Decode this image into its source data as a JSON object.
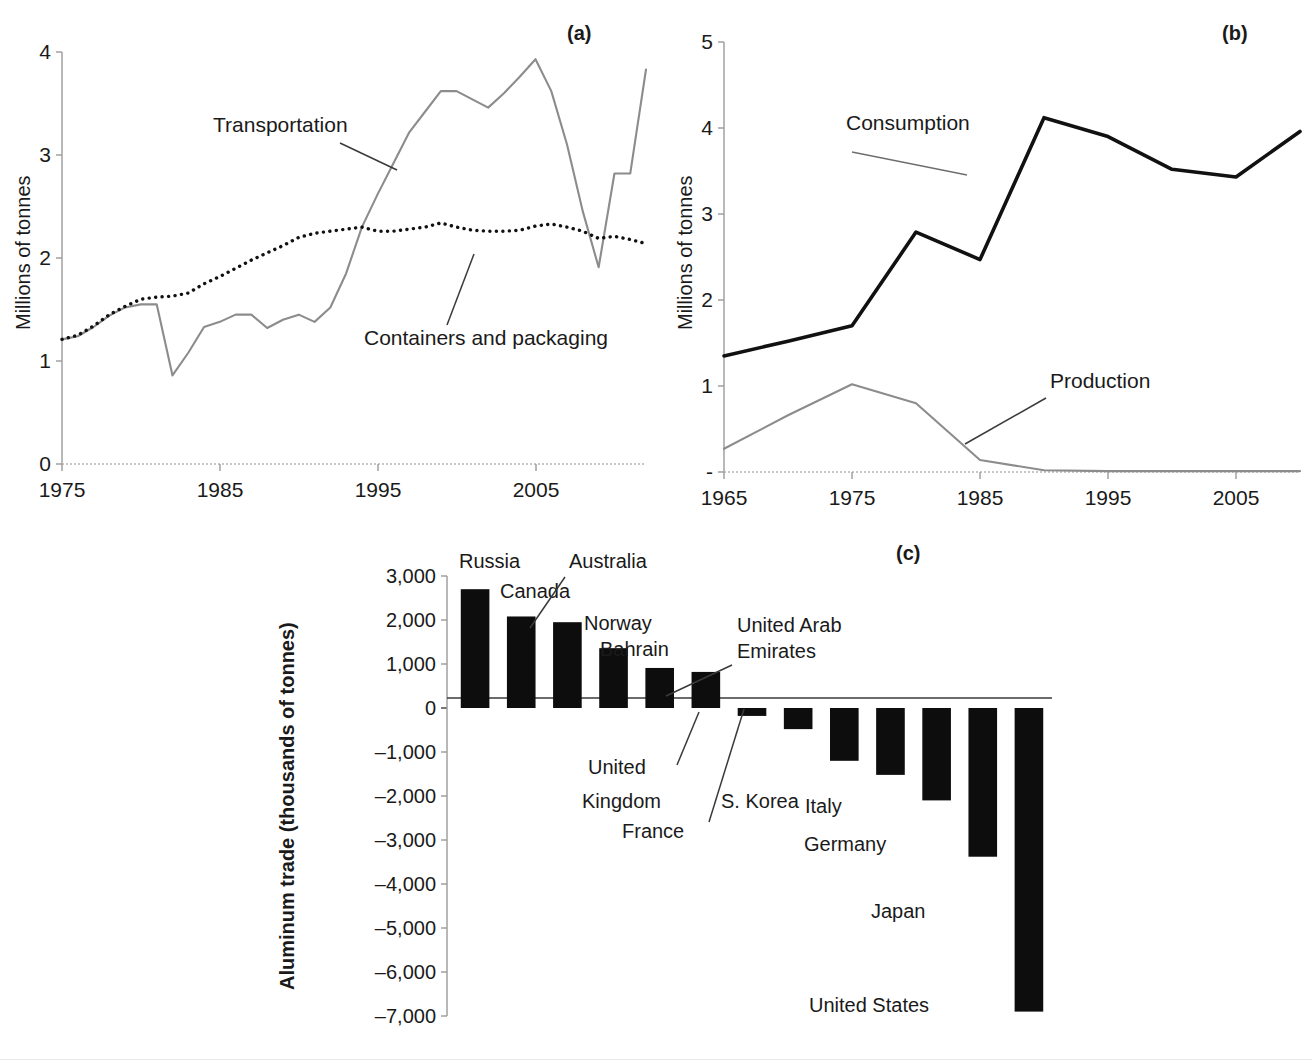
{
  "panels": {
    "a": {
      "tag": "(a)",
      "ylabel": "Millions of tonnes",
      "yticks": [
        "0",
        "1",
        "2",
        "3",
        "4"
      ],
      "xticks": [
        "1975",
        "1985",
        "1995",
        "2005"
      ],
      "series_labels": {
        "transportation": "Transportation",
        "containers": "Containers and packaging"
      }
    },
    "b": {
      "tag": "(b)",
      "ylabel": "Millions of tonnes",
      "yticks": [
        "-",
        "1",
        "2",
        "3",
        "4",
        "5"
      ],
      "xticks": [
        "1965",
        "1975",
        "1985",
        "1995",
        "2005"
      ],
      "series_labels": {
        "consumption": "Consumption",
        "production": "Production"
      }
    },
    "c": {
      "tag": "(c)",
      "ylabel": "Aluminum trade (thousands of tonnes)",
      "yticks": [
        "3,000",
        "2,000",
        "1,000",
        "0",
        "–1,000",
        "–2,000",
        "–3,000",
        "–4,000",
        "–5,000",
        "–6,000",
        "–7,000"
      ]
    }
  },
  "chart_data": [
    {
      "type": "line",
      "panel": "a",
      "title": "",
      "xlabel": "",
      "ylabel": "Millions of tonnes",
      "xlim": [
        1975,
        2012
      ],
      "ylim": [
        0,
        4
      ],
      "grid": false,
      "legend": "inline-annotations",
      "x": [
        1975,
        1976,
        1977,
        1978,
        1979,
        1980,
        1981,
        1982,
        1983,
        1984,
        1985,
        1986,
        1987,
        1988,
        1989,
        1990,
        1991,
        1992,
        1993,
        1994,
        1995,
        1996,
        1997,
        1998,
        1999,
        2000,
        2001,
        2002,
        2003,
        2004,
        2005,
        2006,
        2007,
        2008,
        2009,
        2010,
        2011,
        2012
      ],
      "series": [
        {
          "name": "Transportation",
          "style": "solid-gray",
          "values": [
            1.21,
            1.24,
            1.33,
            1.44,
            1.52,
            1.55,
            1.55,
            0.86,
            1.08,
            1.33,
            1.38,
            1.45,
            1.45,
            1.32,
            1.4,
            1.45,
            1.38,
            1.52,
            1.85,
            2.3,
            2.62,
            2.92,
            3.22,
            3.42,
            3.62,
            3.62,
            3.54,
            3.46,
            3.6,
            3.76,
            3.93,
            3.62,
            3.1,
            2.45,
            1.91,
            2.82,
            2.82,
            3.83
          ]
        },
        {
          "name": "Containers and packaging",
          "style": "dotted-black",
          "values": [
            1.21,
            1.25,
            1.34,
            1.45,
            1.53,
            1.6,
            1.62,
            1.63,
            1.66,
            1.75,
            1.82,
            1.9,
            1.98,
            2.05,
            2.12,
            2.2,
            2.24,
            2.26,
            2.28,
            2.3,
            2.26,
            2.26,
            2.28,
            2.3,
            2.34,
            2.3,
            2.27,
            2.26,
            2.26,
            2.27,
            2.31,
            2.33,
            2.3,
            2.26,
            2.19,
            2.21,
            2.18,
            2.14
          ]
        }
      ]
    },
    {
      "type": "line",
      "panel": "b",
      "title": "",
      "xlabel": "",
      "ylabel": "Millions of tonnes",
      "xlim": [
        1965,
        2010
      ],
      "ylim": [
        0,
        5
      ],
      "grid": false,
      "legend": "inline-annotations",
      "x": [
        1965,
        1970,
        1975,
        1980,
        1985,
        1990,
        1995,
        2000,
        2005,
        2010
      ],
      "series": [
        {
          "name": "Consumption",
          "style": "solid-black",
          "values": [
            1.35,
            1.52,
            1.7,
            2.79,
            2.47,
            4.12,
            3.9,
            3.52,
            3.43,
            3.96
          ]
        },
        {
          "name": "Production",
          "style": "solid-gray",
          "values": [
            0.27,
            0.66,
            1.02,
            0.8,
            0.14,
            0.02,
            0.01,
            0.01,
            0.01,
            0.01
          ]
        }
      ]
    },
    {
      "type": "bar",
      "panel": "c",
      "title": "",
      "xlabel": "",
      "ylabel": "Aluminum trade (thousands of tonnes)",
      "ylim": [
        -7000,
        3000
      ],
      "grid": false,
      "unit": "thousands of tonnes",
      "categories": [
        "Russia",
        "Canada",
        "Australia",
        "Norway",
        "Bahrain",
        "United Arab Emirates",
        "United Kingdom",
        "France",
        "S. Korea",
        "Italy",
        "Germany",
        "Japan",
        "United States"
      ],
      "values": [
        2700,
        2080,
        1950,
        1360,
        910,
        820,
        -180,
        -480,
        -1200,
        -1520,
        -2100,
        -3380,
        -6900
      ]
    }
  ],
  "bar_annotations": [
    {
      "label": "Russia",
      "leader": false
    },
    {
      "label": "Canada",
      "leader": false
    },
    {
      "label": "Australia",
      "leader": true
    },
    {
      "label": "Norway",
      "leader": false
    },
    {
      "label": "Bahrain",
      "leader": false
    },
    {
      "label": "United Arab",
      "leader": true
    },
    {
      "label": "Emirates",
      "leader": false
    },
    {
      "label": "United",
      "leader": true
    },
    {
      "label": "Kingdom",
      "leader": false
    },
    {
      "label": "France",
      "leader": true
    },
    {
      "label": "S. Korea",
      "leader": false
    },
    {
      "label": "Italy",
      "leader": false
    },
    {
      "label": "Germany",
      "leader": false
    },
    {
      "label": "Japan",
      "leader": false
    },
    {
      "label": "United States",
      "leader": false
    }
  ]
}
